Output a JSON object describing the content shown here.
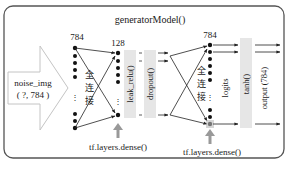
{
  "title": "generatorModel()",
  "input": {
    "name": "noise_img",
    "shape": "( ?, 784 )"
  },
  "layers": {
    "input_units": "784",
    "hidden_units": "128",
    "output_units": "784",
    "fc1_label": "全连接",
    "fc1_chars": [
      "全",
      "连",
      "接"
    ],
    "fc2_label": "全连接",
    "fc2_chars": [
      "全",
      "连",
      "接"
    ],
    "activation1": "leak_relu()",
    "dropout": "dropout()",
    "logits": "logits",
    "activation2": "tanh()",
    "output": "output (784)",
    "dense1_label": "tf.layers.dense()",
    "dense2_label": "tf.layers.dense()"
  },
  "colors": {
    "frame": "#555555",
    "input_arrow": "#bbbbbb",
    "bar": "#e6e6e6",
    "up_arrow": "#999999",
    "node": "#111111",
    "line": "#222222"
  }
}
